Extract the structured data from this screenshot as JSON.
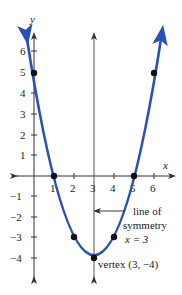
{
  "graph": {
    "axis_labels": {
      "x": "x",
      "y": "y"
    },
    "x_ticks": [
      "1",
      "2",
      "3",
      "4",
      "5",
      "6"
    ],
    "y_ticks": [
      "6",
      "5",
      "4",
      "3",
      "2",
      "1",
      "−1",
      "−2",
      "−3",
      "−4"
    ],
    "function": "y = (x − 3)² − 4",
    "points": [
      {
        "x": 0,
        "y": 5
      },
      {
        "x": 1,
        "y": 0
      },
      {
        "x": 2,
        "y": -3
      },
      {
        "x": 3,
        "y": -4
      },
      {
        "x": 4,
        "y": -3
      },
      {
        "x": 5,
        "y": 0
      },
      {
        "x": 6,
        "y": 5
      }
    ],
    "annotations": {
      "symmetry_line1": "line of",
      "symmetry_line2": "symmetry",
      "symmetry_eq": "x = 3",
      "vertex": "vertex (3, −4)"
    },
    "colors": {
      "curve": "#2b4fb8",
      "axis": "#333333",
      "symmetry": "#555555",
      "point": "#111111"
    }
  }
}
